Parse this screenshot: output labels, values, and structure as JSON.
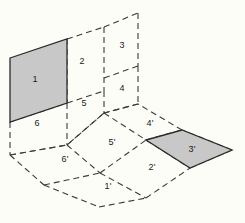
{
  "diagram": {
    "background_color": "#fdfdf7",
    "line_color": "#3a3a3a",
    "shade_color": "#c8c8c8",
    "shade_stroke_color": "#2b2b2b",
    "line_style": "dashed",
    "planes": [
      {
        "name": "vertical-wall-plane",
        "faces": [
          {
            "id": "face-1",
            "label": "1",
            "shaded": true,
            "polygon": "10,58 67,39 67,103 10,122"
          },
          {
            "id": "face-2",
            "label": "2",
            "shaded": false,
            "polygon": "67,39 104,27 104,91 67,103"
          },
          {
            "id": "face-3",
            "label": "3",
            "shaded": false,
            "polygon": "104,27 138,13 138,66 104,78"
          },
          {
            "id": "face-6",
            "label": "6",
            "shaded": false,
            "polygon": "10,122 67,103 67,145 10,155"
          },
          {
            "id": "face-5",
            "label": "5",
            "shaded": false,
            "polygon": "67,103 104,91 104,113 67,145"
          },
          {
            "id": "face-4",
            "label": "4",
            "shaded": false,
            "polygon": "104,78 138,66 138,104 104,113"
          }
        ]
      },
      {
        "name": "horizontal-floor-plane",
        "faces": [
          {
            "id": "face-6p",
            "label": "6'",
            "shaded": false,
            "polygon": "10,155 67,145 100,173 44,185"
          },
          {
            "id": "face-5p",
            "label": "5'",
            "shaded": false,
            "polygon": "67,145 104,113 146,140 100,173"
          },
          {
            "id": "face-4p",
            "label": "4'",
            "shaded": false,
            "polygon": "104,113 138,104 182,130 146,140"
          },
          {
            "id": "face-1p",
            "label": "1'",
            "shaded": false,
            "polygon": "44,185 100,173 146,198 99,207"
          },
          {
            "id": "face-2p",
            "label": "2'",
            "shaded": false,
            "polygon": "100,173 146,140 190,168 146,198"
          },
          {
            "id": "face-3p",
            "label": "3'",
            "shaded": true,
            "polygon": "146,140 182,130 232,150 190,168"
          }
        ]
      }
    ],
    "labels": [
      {
        "name": "label-1",
        "text": "1",
        "x": 35,
        "y": 79
      },
      {
        "name": "label-2",
        "text": "2",
        "x": 82,
        "y": 61
      },
      {
        "name": "label-3",
        "text": "3",
        "x": 122,
        "y": 45
      },
      {
        "name": "label-4",
        "text": "4",
        "x": 122,
        "y": 88
      },
      {
        "name": "label-5",
        "text": "5",
        "x": 84,
        "y": 103
      },
      {
        "name": "label-6",
        "text": "6",
        "x": 37,
        "y": 123
      },
      {
        "name": "label-4p",
        "text": "4'",
        "x": 150,
        "y": 123
      },
      {
        "name": "label-5p",
        "text": "5'",
        "x": 112,
        "y": 142
      },
      {
        "name": "label-6p",
        "text": "6'",
        "x": 65,
        "y": 159
      },
      {
        "name": "label-3p",
        "text": "3'",
        "x": 192,
        "y": 149
      },
      {
        "name": "label-2p",
        "text": "2'",
        "x": 152,
        "y": 167
      },
      {
        "name": "label-1p",
        "text": "1'",
        "x": 108,
        "y": 186
      }
    ],
    "dashed_edges": [
      "67,39 67,103",
      "67,103 67,145",
      "104,27 104,91",
      "104,91 104,113",
      "138,13 138,66",
      "138,66 138,104",
      "10,122 10,155",
      "67,39 104,27",
      "104,27 138,13",
      "67,103 104,91",
      "104,91 138,78",
      "104,78 138,66",
      "10,122 67,103",
      "10,155 67,145",
      "67,145 104,113",
      "104,113 138,104",
      "10,155 44,185",
      "44,185 99,207",
      "99,207 146,198",
      "146,198 190,168",
      "190,168 232,150",
      "232,150 182,130",
      "182,130 138,104",
      "67,145 100,173",
      "100,173 146,198",
      "104,113 146,140",
      "146,140 190,168",
      "44,185 100,173",
      "100,173 146,140",
      "146,140 182,130",
      "10,155 10,122"
    ]
  }
}
